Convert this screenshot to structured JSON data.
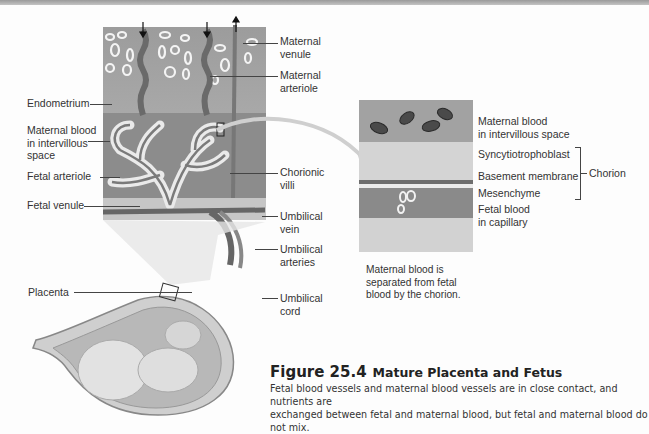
{
  "figure": {
    "number": "Figure 25.4",
    "title": "Mature Placenta and Fetus",
    "caption": "Fetal blood vessels and maternal blood vessels are in close contact, and nutrients are\nexchanged between fetal and maternal blood, but fetal and maternal blood do not mix."
  },
  "main_diagram": {
    "labels_left": [
      {
        "text": "Endometrium"
      },
      {
        "text": "Maternal blood\nin intervillous\nspace"
      },
      {
        "text": "Fetal arteriole"
      },
      {
        "text": "Fetal venule"
      },
      {
        "text": "Placenta"
      }
    ],
    "labels_right": [
      {
        "text": "Maternal\nvenule"
      },
      {
        "text": "Maternal\narteriole"
      },
      {
        "text": "Chorionic\nvilli"
      },
      {
        "text": "Umbilical\nvein"
      },
      {
        "text": "Umbilical\narteries"
      },
      {
        "text": "Umbilical\ncord"
      }
    ]
  },
  "detail_diagram": {
    "labels": [
      {
        "text": "Maternal blood\nin intervillous space"
      },
      {
        "text": "Syncytiotrophoblast"
      },
      {
        "text": "Basement membrane"
      },
      {
        "text": "Mesenchyme"
      },
      {
        "text": "Fetal blood\nin capillary"
      }
    ],
    "bracket_label": "Chorion",
    "note": "Maternal blood is\nseparated from fetal\nblood by the chorion."
  },
  "colors": {
    "tissue_dark": "#8e8e8e",
    "tissue_mid": "#a8a8a8",
    "tissue_light": "#d8d8d8",
    "background": "#fdfdfd"
  }
}
